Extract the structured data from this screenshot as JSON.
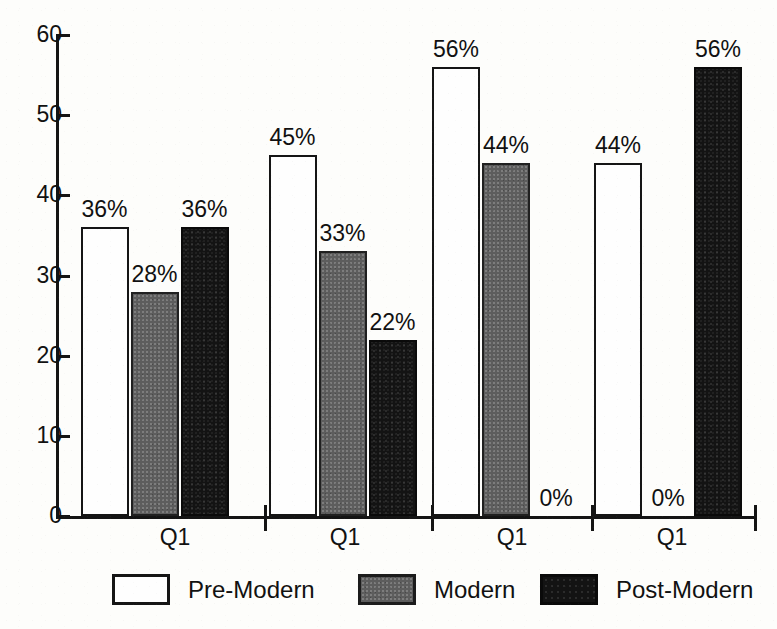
{
  "chart_data": {
    "type": "bar",
    "title": "",
    "subtitle": "",
    "xlabel": "",
    "ylabel": "",
    "ylim": [
      0,
      60
    ],
    "yticks": [
      0,
      10,
      20,
      30,
      40,
      50,
      60
    ],
    "grid": false,
    "legend_position": "bottom",
    "categories": [
      "Q1",
      "Q1",
      "Q1",
      "Q1"
    ],
    "series": [
      {
        "name": "Pre-Modern",
        "color": "#ffffff",
        "values": [
          36,
          45,
          56,
          44
        ],
        "labels": [
          "36%",
          "45%",
          "56%",
          "44%"
        ]
      },
      {
        "name": "Modern",
        "color": "#5d5d5d",
        "values": [
          28,
          33,
          44,
          0
        ],
        "labels": [
          "28%",
          "33%",
          "44%",
          "0%"
        ]
      },
      {
        "name": "Post-Modern",
        "color": "#131313",
        "values": [
          36,
          22,
          0,
          56
        ],
        "labels": [
          "36%",
          "22%",
          "0%",
          "56%"
        ]
      }
    ]
  },
  "axis": {
    "y_tick_labels": [
      "60",
      "50",
      "40",
      "30",
      "20",
      "10",
      "0"
    ],
    "x_group_labels": [
      "Q1",
      "Q1",
      "Q1",
      "Q1"
    ]
  },
  "legend": {
    "items": [
      {
        "label": "Pre-Modern",
        "swatch": "white-outlined-square"
      },
      {
        "label": "Modern",
        "swatch": "gray-filled-square"
      },
      {
        "label": "Post-Modern",
        "swatch": "black-filled-square"
      }
    ]
  },
  "colors": {
    "ink": "#141414",
    "paper": "#fdfdfb",
    "series_pre_modern": "#ffffff",
    "series_modern": "#5d5d5d",
    "series_post_modern": "#131313"
  }
}
